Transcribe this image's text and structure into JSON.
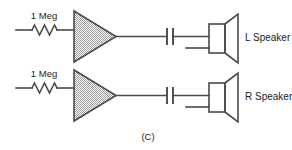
{
  "figure": {
    "caption": "(C)",
    "colors": {
      "line": "#4a4a4a",
      "text": "#1c1c1c",
      "amplifier_fill": "#d9d9d9",
      "background": "#ffffff"
    }
  },
  "channels": [
    {
      "id": "left",
      "resistor_label": "1 Meg",
      "amplifier_label": "",
      "capacitor_label": "",
      "speaker_label": "L Speaker"
    },
    {
      "id": "right",
      "resistor_label": "1 Meg",
      "amplifier_label": "",
      "capacitor_label": "",
      "speaker_label": "R Speaker"
    }
  ]
}
